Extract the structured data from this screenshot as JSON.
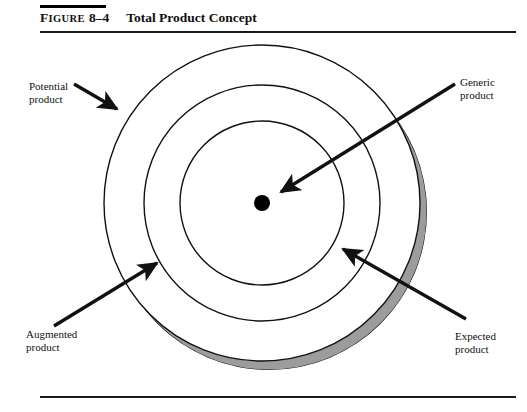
{
  "figure": {
    "label_prefix": "F",
    "label_rest": "IGURE",
    "number": "8–4",
    "title": "Total Product Concept"
  },
  "diagram": {
    "type": "concentric-circles",
    "center": {
      "x": 262,
      "y": 203
    },
    "center_dot_radius": 8,
    "rings": [
      {
        "name": "inner-ring",
        "radius": 82
      },
      {
        "name": "middle-ring",
        "radius": 118
      },
      {
        "name": "outer-ring",
        "radius": 158
      }
    ],
    "shadow_offset": {
      "x": 7,
      "y": 9
    },
    "colors": {
      "stroke": "#111111",
      "shadow_fill": "#9c9c9c",
      "center_dot": "#000000",
      "background": "#ffffff"
    }
  },
  "callouts": [
    {
      "id": "potential",
      "line1": "Potential",
      "line2": "product",
      "arrow_from": {
        "x": 74,
        "y": 84
      },
      "arrow_to": {
        "x": 119,
        "y": 111
      }
    },
    {
      "id": "generic",
      "line1": "Generic",
      "line2": "product",
      "arrow_from": {
        "x": 455,
        "y": 84
      },
      "arrow_to": {
        "x": 279,
        "y": 193
      }
    },
    {
      "id": "augmented",
      "line1": "Augmented",
      "line2": "product",
      "arrow_from": {
        "x": 54,
        "y": 326
      },
      "arrow_to": {
        "x": 159,
        "y": 261
      }
    },
    {
      "id": "expected",
      "line1": "Expected",
      "line2": "product",
      "arrow_from": {
        "x": 466,
        "y": 319
      },
      "arrow_to": {
        "x": 341,
        "y": 247
      }
    }
  ]
}
